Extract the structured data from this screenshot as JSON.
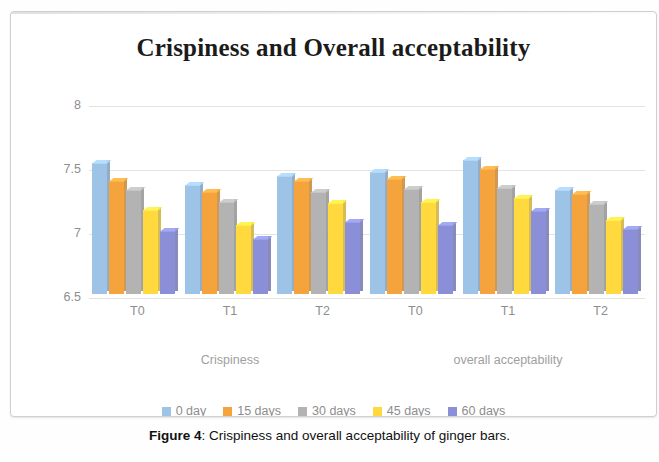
{
  "caption": {
    "figure_label": "Figure 4",
    "separator": ": ",
    "text": "Crispiness and overall acceptability of ginger bars."
  },
  "chart_data": {
    "type": "bar",
    "title": "Crispiness and Overall acceptability",
    "xlabel": "",
    "ylabel": "",
    "ylim": [
      6.5,
      8
    ],
    "yticks": [
      "6.5",
      "7",
      "7.5",
      "8"
    ],
    "grid": true,
    "legend_position": "bottom",
    "categories": [
      "T0",
      "T1",
      "T2",
      "T0",
      "T1",
      "T2"
    ],
    "group_labels": [
      "Crispiness",
      "overall acceptability"
    ],
    "series": [
      {
        "name": "0 day",
        "color": "#9DC3E6",
        "values": [
          7.52,
          7.35,
          7.42,
          7.45,
          7.55,
          7.31
        ]
      },
      {
        "name": "15 days",
        "color": "#F5A33C",
        "values": [
          7.38,
          7.3,
          7.38,
          7.4,
          7.48,
          7.28
        ]
      },
      {
        "name": "30 days",
        "color": "#B3B3B3",
        "values": [
          7.31,
          7.22,
          7.3,
          7.32,
          7.33,
          7.2
        ]
      },
      {
        "name": "45 days",
        "color": "#FFD93D",
        "values": [
          7.16,
          7.04,
          7.21,
          7.22,
          7.25,
          7.08
        ]
      },
      {
        "name": "60 days",
        "color": "#8A8FD8",
        "values": [
          6.99,
          6.93,
          7.06,
          7.04,
          7.15,
          7.01
        ]
      }
    ]
  }
}
